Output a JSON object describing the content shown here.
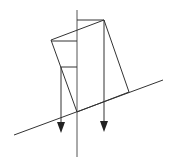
{
  "diagram": {
    "stroke_color": "#333333",
    "axis_color": "#555555",
    "background": "#ffffff",
    "incline": {
      "x1": 14,
      "y1": 135,
      "x2": 163,
      "y2": 80
    },
    "vertical_axis": {
      "x": 77,
      "y1": 10,
      "y2": 157
    },
    "block": {
      "points": [
        [
          51,
          40
        ],
        [
          104,
          20
        ],
        [
          129,
          92
        ],
        [
          77,
          112
        ]
      ]
    },
    "horizontal_ticks": [
      {
        "x1": 77,
        "x2": 104,
        "y": 20
      },
      {
        "x1": 51,
        "x2": 77,
        "y": 41
      },
      {
        "x1": 61,
        "x2": 77,
        "y": 67
      }
    ],
    "arrows": [
      {
        "x": 61,
        "y1": 67,
        "y2": 132
      },
      {
        "x": 104,
        "y1": 20,
        "y2": 131
      }
    ]
  }
}
